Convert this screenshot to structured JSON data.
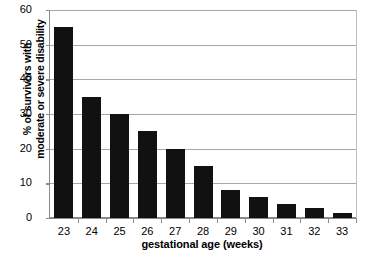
{
  "chart_data": {
    "type": "bar",
    "title": "",
    "xlabel": "gestational age (weeks)",
    "ylabel_line1": "% of survivors with",
    "ylabel_line2": "moderate or severe disability",
    "categories": [
      "23",
      "24",
      "25",
      "26",
      "27",
      "28",
      "29",
      "30",
      "31",
      "32",
      "33"
    ],
    "values": [
      55,
      35,
      30,
      25,
      20,
      15,
      8,
      6,
      4,
      3,
      1.5
    ],
    "yticks": [
      0,
      10,
      20,
      30,
      40,
      50,
      60
    ],
    "ytick_labels": [
      "0",
      "10",
      "20",
      "30",
      "40",
      "50",
      "60"
    ],
    "ylim": [
      0,
      60
    ],
    "grid": true,
    "legend": "none",
    "bar_color": "#111111",
    "grid_color": "#a8a8a8",
    "axis_color": "#8a8a8a",
    "background": "#ffffff"
  }
}
